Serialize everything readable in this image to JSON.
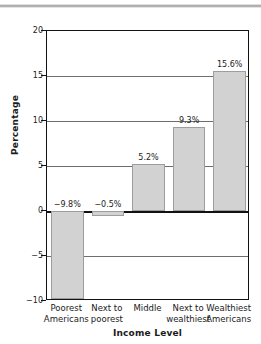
{
  "chart_data": {
    "type": "bar",
    "title": "",
    "xlabel": "Income Level",
    "ylabel": "Percentage",
    "categories": [
      "Poorest Americans",
      "Next to poorest",
      "Middle",
      "Next to wealthiest",
      "Wealthiest Americans"
    ],
    "category_lines": [
      [
        "Poorest",
        "Americans"
      ],
      [
        "Next to",
        "poorest"
      ],
      [
        "Middle",
        ""
      ],
      [
        "Next to",
        "wealthiest"
      ],
      [
        "Wealthiest",
        "Americans"
      ]
    ],
    "values": [
      -9.8,
      -0.5,
      5.2,
      9.3,
      15.6
    ],
    "data_labels": [
      "−9.8%",
      "−0.5%",
      "5.2%",
      "9.3%",
      "15.6%"
    ],
    "ylim": [
      -10,
      20
    ],
    "yticks": [
      20,
      15,
      10,
      5,
      0,
      -5,
      -10
    ],
    "ytick_labels": [
      "20",
      "15",
      "10",
      "5",
      "0",
      "−5",
      "−10"
    ],
    "grid": true,
    "grid_axis": "y",
    "legend": "none",
    "bar_fill_color": "#d2d2d2",
    "bar_edge_color": "#9d9d9d",
    "axis_color": "#111111",
    "grid_color": "#6e6e6e",
    "text_color": "#1b1b1b"
  }
}
